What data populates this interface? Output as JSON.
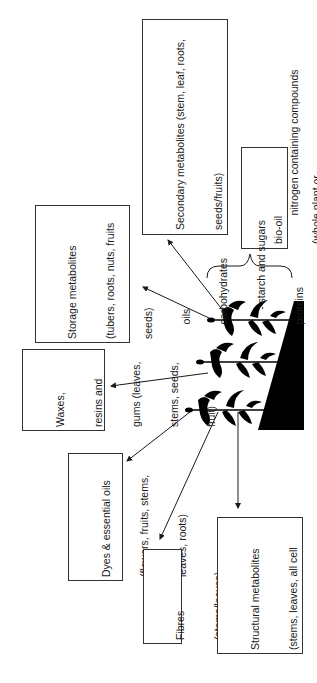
{
  "diagram": {
    "boxes": [
      {
        "id": "secondary",
        "lines": [
          "Secondary metabolites (stem, leaf, roots,",
          "seeds/fruits)",
          "     phenolics",
          "     nitrogen containing compounds",
          "          - alkaloids",
          "     terpenes/terpenoids"
        ]
      },
      {
        "id": "biooil",
        "lines": [
          "bio-oil",
          "(whole plant or",
          "harvest residues)"
        ]
      },
      {
        "id": "storage",
        "lines": [
          "Storage metabolites",
          "(tubers, roots, nuts, fruits",
          "seeds)",
          "     oils",
          "     carbohydrates",
          "          - starch and sugars",
          "     proteins"
        ]
      },
      {
        "id": "waxes",
        "lines": [
          "Waxes,",
          "resins and",
          "gums (leaves,",
          "stems, seeds,",
          "fruit)"
        ]
      },
      {
        "id": "dyes",
        "lines": [
          "Dyes & essential oils",
          "(flowers, fruits, stems,",
          "leaves, roots)"
        ]
      },
      {
        "id": "fibres",
        "lines": [
          "Fibres",
          "(stems/leaves)"
        ]
      },
      {
        "id": "structural",
        "lines": [
          "Structural metabolites",
          "(stems, leaves, all cell",
          "walls):",
          "     cellulose",
          "     hemicellulose",
          "     lignin"
        ]
      }
    ],
    "colors": {
      "line": "#1a1a1a",
      "border": "#333333",
      "fill": "#000000"
    }
  }
}
